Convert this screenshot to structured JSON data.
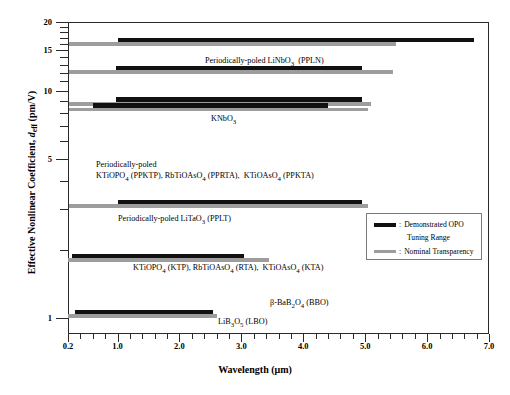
{
  "chart_data": {
    "type": "bar",
    "orientation": "horizontal",
    "title": "",
    "xlabel": "Wavelength (μm)",
    "ylabel": "Effective Nonlinear Coefficient, d_eff (pm/V)",
    "ylabel_parts": {
      "main": "Effective Nonlinear Coefficient,",
      "symbol": "d",
      "symbol_sub": "eff",
      "units": "(pm/V)"
    },
    "xscale": "linear",
    "yscale": "log",
    "xlim": [
      0.2,
      7.0
    ],
    "ylim": [
      0.85,
      20
    ],
    "grid": false,
    "xticks_major": [
      0.2,
      1.0,
      2.0,
      3.0,
      4.0,
      5.0,
      6.0,
      7.0
    ],
    "xtick_labels": [
      "0.2",
      "1.0",
      "2.0",
      "3.0",
      "4.0",
      "5.0",
      "6.0",
      "7.0"
    ],
    "xticks_minor": [
      0.4,
      0.6,
      0.8,
      1.2,
      1.4,
      1.6,
      1.8,
      2.2,
      2.4,
      2.6,
      2.8,
      3.2,
      3.4,
      3.6,
      3.8,
      4.2,
      4.4,
      4.6,
      4.8,
      5.2,
      5.4,
      5.6,
      5.8,
      6.2,
      6.4,
      6.6,
      6.8
    ],
    "yticks_major": [
      1,
      5,
      10,
      15,
      20
    ],
    "ytick_labels": [
      "1",
      "5",
      "10",
      "15",
      "20"
    ],
    "yticks_minor": [
      2,
      3,
      4,
      6,
      7,
      8,
      9,
      11,
      12,
      13,
      14,
      16,
      17,
      18,
      19
    ],
    "series": [
      {
        "name": "Demonstrated OPO Tuning Range",
        "color": "#111111",
        "key": "demonstrated"
      },
      {
        "name": "Nominal Transparency",
        "color": "#9d9d9d",
        "key": "transparency"
      }
    ],
    "materials": [
      {
        "id": "ppln",
        "label": "Periodically-poled LiNbO3  (PPLN)",
        "label_html": "Periodically-poled LiNbO<sub>3</sub>&nbsp; (PPLN)",
        "d_eff": 16.5,
        "demonstrated": [
          1.0,
          6.75
        ],
        "transparency": [
          0.21,
          5.5
        ]
      },
      {
        "id": "knbo3",
        "label": "KNbO3",
        "label_html": "KNbO<sub>3</sub>",
        "d_eff": 12.4,
        "demonstrated": [
          0.97,
          4.95
        ],
        "transparency": [
          0.21,
          5.45
        ]
      },
      {
        "id": "ppktp",
        "label": "Periodically-poled KTiOPO4 (PPKTP), RbTiOAsO4 (PPRTA),  KTiOAsO4 (PPKTA)",
        "label_line1": "Periodically-poled",
        "label_line2_html": "KTiOPO<sub>4</sub> (PPKTP), RbTiOAsO<sub>4</sub> (PPRTA),&nbsp; KTiOAsO<sub>4</sub> (PPKTA)",
        "d_eff": 9.0,
        "demonstrated": [
          0.98,
          4.95
        ],
        "transparency": [
          0.22,
          5.1
        ]
      },
      {
        "id": "pplt",
        "label": "Periodically-poled LiTaO3 (PPLT)",
        "label_html": "Periodically-poled LiTaO<sub>3</sub> (PPLT)",
        "d_eff": 8.5,
        "demonstrated": [
          0.6,
          4.4
        ],
        "transparency": [
          0.22,
          5.05
        ]
      },
      {
        "id": "ktp",
        "label": "KTiOPO4 (KTP), RbTiOAsO4 (RTA),  KTiOAsO4 (KTA)",
        "label_html": "KTiOPO<sub>4</sub> (KTP), RbTiOAsO<sub>4</sub> (RTA),&nbsp; KTiOAsO<sub>4</sub> (KTA)",
        "d_eff": 3.2,
        "demonstrated": [
          1.0,
          4.95
        ],
        "transparency": [
          0.22,
          5.05
        ]
      },
      {
        "id": "bbo",
        "label": "β-BaB2O4 (BBO)",
        "label_html": "β-BaB<sub>2</sub>O<sub>4</sub> (BBO)",
        "d_eff": 1.85,
        "demonstrated": [
          0.27,
          3.05
        ],
        "transparency": [
          0.2,
          3.45
        ]
      },
      {
        "id": "lbo",
        "label": "LiB3O5 (LBO)",
        "label_html": "LiB<sub>3</sub>O<sub>5</sub> (LBO)",
        "d_eff": 1.05,
        "demonstrated": [
          0.32,
          2.55
        ],
        "transparency": [
          0.2,
          2.6
        ]
      }
    ]
  },
  "legend": {
    "separator": ":",
    "items": [
      {
        "label_line1": "Demonstrated OPO",
        "label_line2": "Tuning Range",
        "color": "#111111"
      },
      {
        "label_line1": "Nominal Transparency",
        "label_line2": "",
        "color": "#9d9d9d"
      }
    ]
  },
  "colors": {
    "black_bar": "#111111",
    "gray_bar": "#9d9d9d",
    "axis": "#2a2a2a",
    "background": "#ffffff"
  }
}
